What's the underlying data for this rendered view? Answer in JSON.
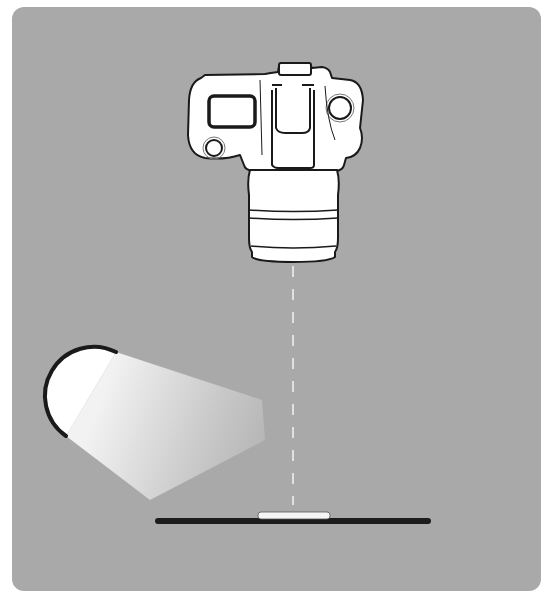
{
  "diagram": {
    "title": "Overhead copy-stand lighting setup",
    "colors": {
      "background": "#a9a9a9",
      "outline": "#1a1a1a",
      "fill": "#ffffff",
      "surface": "#1c1c1c",
      "subject": "#f4f4f4",
      "beam": "#ffffff"
    },
    "elements": {
      "camera": {
        "label": "Camera (top view, lens pointing down)",
        "icon": "camera-icon"
      },
      "axis": {
        "label": "Optical axis (dashed line)",
        "icon": "dashed-line"
      },
      "light": {
        "label": "Light source",
        "icon": "light-icon"
      },
      "beam": {
        "label": "Light beam",
        "icon": "beam-icon"
      },
      "surface": {
        "label": "Copy surface / baseboard",
        "icon": "surface-icon"
      },
      "subject": {
        "label": "Flat subject",
        "icon": "subject-icon"
      }
    }
  }
}
